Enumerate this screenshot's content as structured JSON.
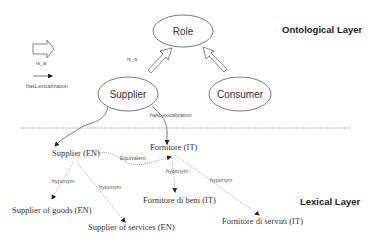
{
  "layers": {
    "ontological": "Ontological Layer",
    "lexical": "Lexical Layer"
  },
  "legend": {
    "is_a_label": "is_a",
    "has_lexicalization_label": "hasLexicalization"
  },
  "ontology_nodes": {
    "role": "Role",
    "supplier": "Supplier",
    "consumer": "Consumer"
  },
  "ontology_edges": {
    "supplier_is_a_role": "is_a",
    "supplier_has_lexicalization": "hasLexicalization"
  },
  "lexical_nodes": {
    "supplier_en": "Supplier (EN)",
    "fornitore_it": "Fornitore (IT)",
    "supplier_goods_en": "Supplier of goods (EN)",
    "supplier_services_en": "Supplier of services (EN)",
    "fornitore_beni_it": "Fornitore di beni (IT)",
    "fornitore_servizi_it": "Fornitore di servizi (IT)"
  },
  "lexical_edges": {
    "equivalent": "Equivalent",
    "hyponym_goods": "hyponym",
    "hyponym_services": "hyponym",
    "hyponym_beni": "hyponym",
    "hyponym_servizi": "hyponym"
  },
  "colors": {
    "stroke": "#555555",
    "text": "#333333",
    "divider": "#777777",
    "background": "#ffffff"
  }
}
